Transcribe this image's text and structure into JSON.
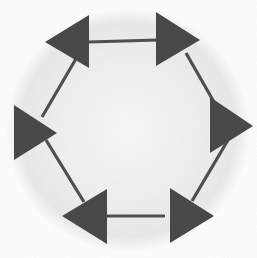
{
  "figure": {
    "kind": "cyclic-arrow-diagram",
    "shape": "hexagon",
    "node_count": 6,
    "width": 257,
    "height": 258,
    "colors": {
      "arrow_fill": "#4a4a4a",
      "connector_stroke": "#4f4f4f",
      "background": "#fdfdfd",
      "halo": "#eeeeee",
      "halo_edge": "#e4e4e4"
    },
    "halo": {
      "shape": "circle",
      "cx": 128,
      "cy": 130,
      "r": 122
    },
    "connector_stroke_width": 3.2,
    "arrows": [
      {
        "id": "arrow-top-left",
        "label": "top-left",
        "direction": "left",
        "apex_x": 45,
        "apex_y": 42,
        "base_x": 89,
        "base_top_y": 15,
        "base_bottom_y": 68
      },
      {
        "id": "arrow-top-right",
        "label": "top-right",
        "direction": "right",
        "apex_x": 200,
        "apex_y": 40,
        "base_x": 156,
        "base_top_y": 12,
        "base_bottom_y": 66
      },
      {
        "id": "arrow-right",
        "label": "right",
        "direction": "right",
        "apex_x": 253,
        "apex_y": 126,
        "base_x": 210,
        "base_top_y": 97,
        "base_bottom_y": 153
      },
      {
        "id": "arrow-bottom-right",
        "label": "bottom-right",
        "direction": "right",
        "apex_x": 214,
        "apex_y": 216,
        "base_x": 170,
        "base_top_y": 188,
        "base_bottom_y": 243
      },
      {
        "id": "arrow-bottom-left",
        "label": "bottom-left",
        "direction": "left",
        "apex_x": 62,
        "apex_y": 216,
        "base_x": 107,
        "base_top_y": 189,
        "base_bottom_y": 244
      },
      {
        "id": "arrow-left",
        "label": "left",
        "direction": "right",
        "apex_x": 57,
        "apex_y": 133,
        "base_x": 14,
        "base_top_y": 105,
        "base_bottom_y": 160
      }
    ],
    "connectors": [
      {
        "id": "connector-top",
        "label": "top horizontal",
        "x1": 88,
        "y1": 42,
        "x2": 158,
        "y2": 40
      },
      {
        "id": "connector-upper-right",
        "label": "upper-right diagonal",
        "x1": 186,
        "y1": 53,
        "x2": 222,
        "y2": 116
      },
      {
        "id": "connector-lower-right",
        "label": "lower-right diagonal",
        "x1": 228,
        "y1": 140,
        "x2": 192,
        "y2": 201
      },
      {
        "id": "connector-bottom",
        "label": "bottom horizontal",
        "x1": 165,
        "y1": 216,
        "x2": 96,
        "y2": 216
      },
      {
        "id": "connector-lower-left",
        "label": "lower-left diagonal",
        "x1": 84,
        "y1": 202,
        "x2": 46,
        "y2": 140
      },
      {
        "id": "connector-upper-left",
        "label": "upper-left diagonal",
        "x1": 42,
        "y1": 117,
        "x2": 77,
        "y2": 57
      }
    ]
  }
}
